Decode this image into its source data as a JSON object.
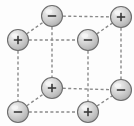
{
  "figure": {
    "background_color": "#fdfdfd",
    "bond_color": "#8a8a8a",
    "bond_style": "dashed",
    "bond_dash": "3,2.4",
    "bond_width": 1.4,
    "sphere_outline_color": "#6e6e6e",
    "sphere_fill_light": "#f0f0f0",
    "sphere_fill_mid": "#c9c9c9",
    "sphere_fill_dark": "#9d9d9d",
    "sign_color": "#3a3a3a",
    "sphere_radius": 10.5,
    "ions": [
      {
        "id": "front-top-left",
        "label": "+",
        "charge": "positive",
        "cx": 18,
        "cy": 40,
        "depth": "front"
      },
      {
        "id": "front-top-right",
        "label": "−",
        "charge": "negative",
        "cx": 88,
        "cy": 40,
        "depth": "front"
      },
      {
        "id": "front-bottom-left",
        "label": "−",
        "charge": "negative",
        "cx": 18,
        "cy": 112,
        "depth": "front"
      },
      {
        "id": "front-bottom-right",
        "label": "+",
        "charge": "positive",
        "cx": 88,
        "cy": 112,
        "depth": "front"
      },
      {
        "id": "back-top-left",
        "label": "−",
        "charge": "negative",
        "cx": 52,
        "cy": 16,
        "depth": "back"
      },
      {
        "id": "back-top-right",
        "label": "+",
        "charge": "positive",
        "cx": 121,
        "cy": 17,
        "depth": "back"
      },
      {
        "id": "back-bottom-left",
        "label": "+",
        "charge": "positive",
        "cx": 52,
        "cy": 88,
        "depth": "back"
      },
      {
        "id": "back-bottom-right",
        "label": "−",
        "charge": "negative",
        "cx": 121,
        "cy": 90,
        "depth": "back"
      }
    ],
    "bonds": [
      {
        "id": "front-top-edge",
        "x1": 18,
        "y1": 40,
        "x2": 88,
        "y2": 40
      },
      {
        "id": "front-bottom-edge",
        "x1": 18,
        "y1": 112,
        "x2": 88,
        "y2": 112
      },
      {
        "id": "front-left-edge",
        "x1": 18,
        "y1": 40,
        "x2": 18,
        "y2": 112
      },
      {
        "id": "front-right-edge",
        "x1": 88,
        "y1": 40,
        "x2": 88,
        "y2": 112
      },
      {
        "id": "back-top-edge",
        "x1": 52,
        "y1": 16,
        "x2": 121,
        "y2": 17
      },
      {
        "id": "back-bottom-edge",
        "x1": 52,
        "y1": 88,
        "x2": 121,
        "y2": 90
      },
      {
        "id": "back-left-edge",
        "x1": 52,
        "y1": 16,
        "x2": 52,
        "y2": 88
      },
      {
        "id": "back-right-edge",
        "x1": 121,
        "y1": 17,
        "x2": 121,
        "y2": 90
      },
      {
        "id": "depth-edge-top-left",
        "x1": 18,
        "y1": 40,
        "x2": 52,
        "y2": 16
      },
      {
        "id": "depth-edge-top-right",
        "x1": 88,
        "y1": 40,
        "x2": 121,
        "y2": 17
      },
      {
        "id": "depth-edge-bottom-left",
        "x1": 18,
        "y1": 112,
        "x2": 52,
        "y2": 88
      },
      {
        "id": "depth-edge-bottom-right",
        "x1": 88,
        "y1": 112,
        "x2": 121,
        "y2": 90
      }
    ]
  }
}
